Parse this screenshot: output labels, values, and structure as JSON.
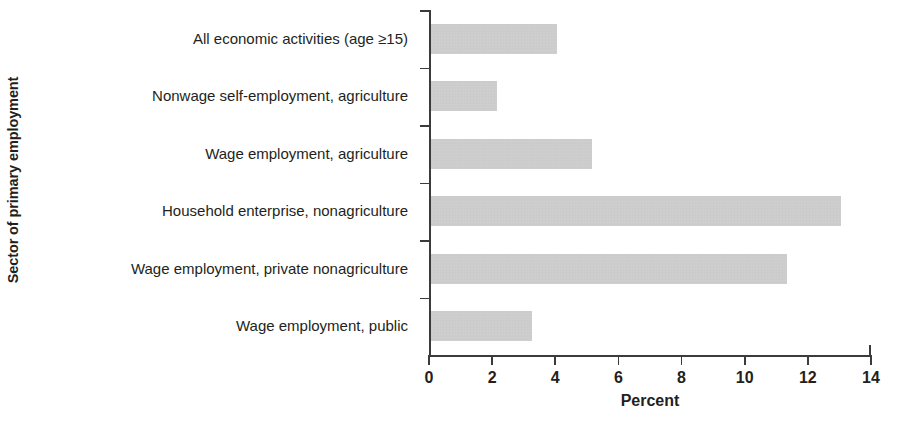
{
  "chart_data": {
    "type": "bar",
    "orientation": "horizontal",
    "title": "",
    "xlabel": "Percent",
    "ylabel": "Sector of primary employment",
    "xlim": [
      0,
      14
    ],
    "xticks": [
      "0",
      "2",
      "4",
      "6",
      "8",
      "10",
      "12",
      "14"
    ],
    "grid": false,
    "legend": null,
    "bar_color": "#c9c9c9",
    "axis_color": "#3b3b3b",
    "categories": [
      "All economic activities (age ≥15)",
      "Nonwage self-employment, agriculture",
      "Wage employment, agriculture",
      "Household enterprise, nonagriculture",
      "Wage employment, private nonagriculture",
      "Wage employment, public"
    ],
    "values": [
      4.0,
      2.1,
      5.1,
      13.0,
      11.3,
      3.2
    ]
  }
}
